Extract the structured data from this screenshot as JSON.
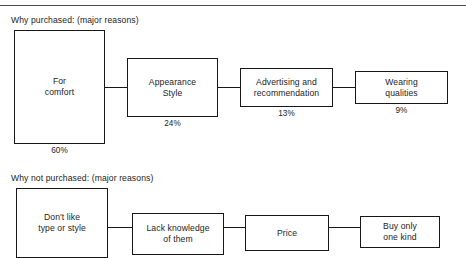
{
  "page": {
    "clipped_header_text": "                                                                   ",
    "sections": [
      {
        "id": "purchased",
        "heading": "Why purchased: (major reasons)",
        "boxes": [
          {
            "label": "For\ncomfort",
            "percent": "60%"
          },
          {
            "label": "Appearance\nStyle",
            "percent": "24%"
          },
          {
            "label": "Advertising  and\nrecommendation",
            "percent": "13%"
          },
          {
            "label": "Wearing\nqualities",
            "percent": "9%"
          }
        ]
      },
      {
        "id": "not-purchased",
        "heading": "Why not purchased: (major reasons)",
        "boxes": [
          {
            "label": "Don't like\ntype or style",
            "percent": ""
          },
          {
            "label": "Lack knowledge\nof them",
            "percent": ""
          },
          {
            "label": "Price",
            "percent": ""
          },
          {
            "label": "Buy only\none kind",
            "percent": ""
          }
        ]
      }
    ]
  },
  "colors": {
    "ink": "#171717",
    "rule": "#4a4a4a",
    "paper": "#ffffff"
  }
}
